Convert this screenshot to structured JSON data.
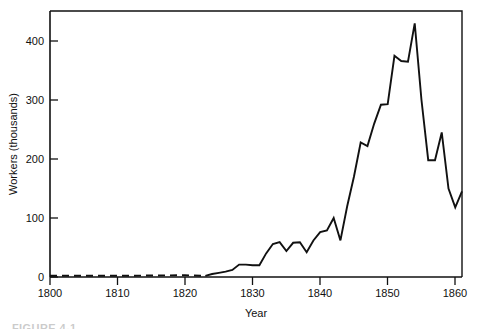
{
  "figure": {
    "caption_partial": "FIGURE 4-1"
  },
  "chart_data": {
    "type": "line",
    "title": "",
    "subtitle": "",
    "xlabel": "Year",
    "ylabel": "Workers (thousands)",
    "xlim": [
      1800,
      1861
    ],
    "ylim": [
      0,
      440
    ],
    "xticks": [
      1800,
      1810,
      1820,
      1830,
      1840,
      1850,
      1860
    ],
    "xtick_labels": [
      "1800",
      "1810",
      "1820",
      "1830",
      "1840",
      "1850",
      "1860"
    ],
    "yticks": [
      0,
      100,
      200,
      300,
      400
    ],
    "ytick_labels": [
      "0",
      "100",
      "200",
      "300",
      "400"
    ],
    "grid": false,
    "legend": "none",
    "line_color": "#111111",
    "series": [
      {
        "name": "Workers (thousands)",
        "style_segments": [
          {
            "style": "dashed",
            "from_x": 1800,
            "to_x": 1823
          },
          {
            "style": "solid",
            "from_x": 1823,
            "to_x": 1861
          }
        ],
        "x": [
          1800,
          1810,
          1820,
          1823,
          1824,
          1825,
          1826,
          1827,
          1828,
          1829,
          1830,
          1831,
          1832,
          1833,
          1834,
          1835,
          1836,
          1837,
          1838,
          1839,
          1840,
          1841,
          1842,
          1843,
          1844,
          1845,
          1846,
          1847,
          1848,
          1849,
          1850,
          1851,
          1852,
          1853,
          1854,
          1855,
          1856,
          1857,
          1858,
          1859,
          1860,
          1861
        ],
        "values": [
          2,
          2,
          3,
          2,
          5,
          7,
          9,
          12,
          21,
          21,
          20,
          20,
          40,
          56,
          59,
          44,
          58,
          59,
          42,
          62,
          76,
          79,
          100,
          62,
          120,
          170,
          228,
          222,
          260,
          292,
          293,
          375,
          366,
          365,
          430,
          300,
          198,
          198,
          245,
          150,
          118,
          145
        ]
      }
    ],
    "annotations": [
      {
        "text": "dashed segment indicates estimated/sparse data 1800–1823"
      }
    ]
  }
}
